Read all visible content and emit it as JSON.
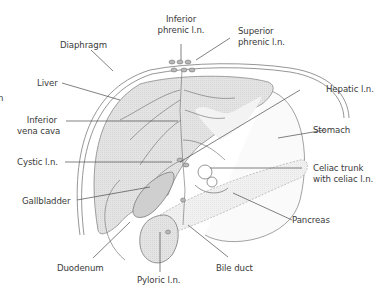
{
  "figure": {
    "type": "anatomical-diagram",
    "colors": {
      "organ_fill": "#e2e2e2",
      "organ_fill_light": "#efefef",
      "outline": "#8a8a8a",
      "leader_line": "#4a4a4a",
      "text": "#3a3a3a"
    }
  },
  "labels": {
    "inferior_phrenic": [
      "Inferior",
      "phrenic l.n."
    ],
    "superior_phrenic": [
      "Superior",
      "phrenic l.n."
    ],
    "diaphragm": "Diaphragm",
    "liver": "Liver",
    "ivc": [
      "Inferior",
      "vena cava"
    ],
    "hepatic": "Hepatic l.n.",
    "stomach": "Stomach",
    "cystic": "Cystic l.n.",
    "celiac": [
      "Celiac trunk",
      "with celiac l.n."
    ],
    "gallbladder": "Gallbladder",
    "pancreas": "Pancreas",
    "duodenum": "Duodenum",
    "bile_duct": "Bile duct",
    "pyloric": "Pyloric l.n.",
    "edge_fragment": "n"
  }
}
